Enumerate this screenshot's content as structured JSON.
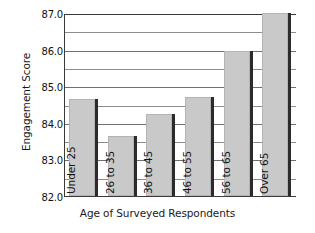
{
  "chart_data": {
    "type": "bar",
    "title": "",
    "xlabel": "Age of Surveyed Respondents",
    "ylabel": "Engagement Score",
    "categories": [
      "Under 25",
      "26 to 35",
      "36 to 45",
      "46 to 55",
      "56 to 65",
      "Over 65"
    ],
    "values": [
      84.65,
      83.65,
      84.25,
      84.7,
      85.95,
      87.0
    ],
    "ylim": [
      82.0,
      87.0
    ],
    "ytick_labels": [
      "82.0",
      "83.0",
      "84.0",
      "85.0",
      "86.0",
      "87.0"
    ],
    "ytick_values": [
      82.0,
      83.0,
      84.0,
      85.0,
      86.0,
      87.0
    ],
    "minor_tick_values": [
      82.5,
      83.5,
      84.5,
      85.5,
      86.5
    ],
    "grid": true,
    "legend": "none",
    "bar_color": "#c9c9c9",
    "bar_shadow_color": "#2b2b2b",
    "axis_color": "#3a3a3a",
    "gridline_color": "#6f6f6f",
    "text_color": "#141414"
  }
}
